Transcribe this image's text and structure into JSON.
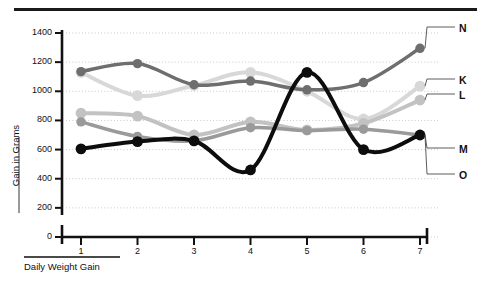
{
  "chart_data": {
    "type": "line",
    "title": "",
    "xlabel": "Daily Weight Gain",
    "ylabel": "Gain in Grams",
    "categories": [
      "1",
      "2",
      "3",
      "4",
      "5",
      "6",
      "7"
    ],
    "x": [
      1,
      2,
      3,
      4,
      5,
      6,
      7
    ],
    "xlim": [
      0.6,
      7.5
    ],
    "ylim": [
      0,
      1400
    ],
    "yticks": [
      0,
      200,
      400,
      600,
      800,
      1000,
      1200,
      1400
    ],
    "ytick_labels": [
      "0",
      "200",
      "400",
      "600",
      "800",
      "1000",
      "1200",
      "1400"
    ],
    "xtick_labels": [
      "1",
      "2",
      "3",
      "4",
      "5",
      "6",
      "7"
    ],
    "grid": true,
    "grid_style": "dotted-horizontal",
    "legend_position": "right-outside",
    "series": [
      {
        "name": "N",
        "label": "N",
        "color": "#6e6e6e",
        "values": [
          1135,
          1190,
          1045,
          1070,
          1010,
          1060,
          1295
        ],
        "markers": true,
        "width": 3.5
      },
      {
        "name": "K",
        "label": "K",
        "color": "#d8d8d8",
        "values": [
          1130,
          970,
          1040,
          1130,
          1000,
          810,
          1035
        ],
        "markers": true,
        "width": 4
      },
      {
        "name": "L",
        "label": "L",
        "color": "#c2c2c2",
        "values": [
          850,
          830,
          700,
          790,
          735,
          780,
          940
        ],
        "markers": true,
        "width": 4
      },
      {
        "name": "M",
        "label": "M",
        "color": "#9a9a9a",
        "values": [
          790,
          690,
          660,
          750,
          730,
          740,
          700
        ],
        "markers": true,
        "width": 3.5
      },
      {
        "name": "O",
        "label": "O",
        "color": "#0d0d0d",
        "values": [
          605,
          655,
          660,
          460,
          1130,
          600,
          700
        ],
        "markers": true,
        "width": 4
      }
    ]
  },
  "legend": {
    "items": [
      {
        "label": "N"
      },
      {
        "label": "K"
      },
      {
        "label": "L"
      },
      {
        "label": "M"
      },
      {
        "label": "O"
      }
    ]
  },
  "axes": {
    "y_title": "Gain in Grams",
    "x_title": "Daily Weight Gain"
  }
}
